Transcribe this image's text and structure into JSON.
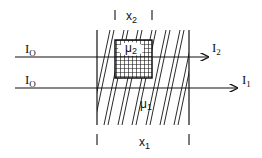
{
  "diagram": {
    "beams": [
      {
        "input_label": "I",
        "input_sub": "O",
        "output_label": "I",
        "output_sub": "2",
        "passes_through": "inclusion"
      },
      {
        "input_label": "I",
        "input_sub": "O",
        "output_label": "I",
        "output_sub": "1",
        "passes_through": "slab only"
      }
    ],
    "slab": {
      "thickness_label": "x",
      "thickness_sub": "1",
      "coef_label": "μ",
      "coef_sub": "1"
    },
    "inclusion": {
      "thickness_label": "x",
      "thickness_sub": "2",
      "coef_label": "μ",
      "coef_sub": "2"
    },
    "colors": {
      "ink": "#111111",
      "background": "#ffffff"
    }
  }
}
